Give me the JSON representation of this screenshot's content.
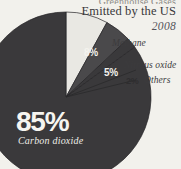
{
  "title": {
    "clipped_line": "Greenhouse Gases",
    "line1": "Emitted by the US",
    "year": "2008"
  },
  "colors": {
    "background": "#f2f1ec",
    "carbon_dioxide": "#3a393b",
    "methane": "#e9e8e3",
    "nitrous_oxide": "#4a494b",
    "others": "#3a393b",
    "label_light": "#f4f3ee",
    "label_dark": "#2e2d2f"
  },
  "labels": {
    "methane_pct": "8%",
    "methane_name": "Methane",
    "nitrous_oxide_pct": "5%",
    "nitrous_oxide_name": "Nitrous oxide",
    "others_pct": "2%",
    "others_name": "Others",
    "carbon_dioxide_pct": "85%",
    "carbon_dioxide_name": "Carbon dioxide"
  },
  "chart_data": {
    "type": "pie",
    "title": "Greenhouse Gases Emitted by the US 2008",
    "subtitle": "2008",
    "unit": "percent",
    "legend": "labels placed beside and inside slices",
    "categories": [
      "Carbon dioxide",
      "Methane",
      "Nitrous oxide",
      "Others"
    ],
    "values": [
      85,
      8,
      5,
      2
    ],
    "slices": [
      {
        "label": "Carbon dioxide",
        "value": 85,
        "display": "85%",
        "color": "#3a393b",
        "label_position": "inside"
      },
      {
        "label": "Methane",
        "value": 8,
        "display": "8%",
        "color": "#e9e8e3",
        "label_position": "inside-and-outside"
      },
      {
        "label": "Nitrous oxide",
        "value": 5,
        "display": "5%",
        "color": "#4a494b",
        "label_position": "outside"
      },
      {
        "label": "Others",
        "value": 2,
        "display": "2%",
        "color": "#3a393b",
        "label_position": "outside"
      }
    ],
    "start_angle_deg": -90,
    "direction": "clockwise",
    "total": 100
  }
}
